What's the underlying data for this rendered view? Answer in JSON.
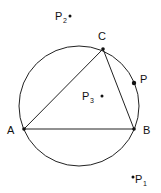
{
  "diagram": {
    "circle": {
      "cx": 79,
      "cy": 106,
      "r": 60
    },
    "triangle": {
      "vertices": [
        "A",
        "B",
        "C"
      ]
    },
    "points": {
      "A": {
        "label": "A",
        "x": 24,
        "y": 129
      },
      "B": {
        "label": "B",
        "x": 134,
        "y": 129
      },
      "C": {
        "label": "C",
        "x": 103,
        "y": 49
      },
      "P": {
        "label": "P",
        "x": 134,
        "y": 83
      },
      "P1": {
        "label": "P",
        "sub": "1",
        "x": 133,
        "y": 177
      },
      "P2": {
        "label": "P",
        "sub": "2",
        "x": 70,
        "y": 16
      },
      "P3": {
        "label": "P",
        "sub": "3",
        "x": 102,
        "y": 96
      }
    }
  }
}
